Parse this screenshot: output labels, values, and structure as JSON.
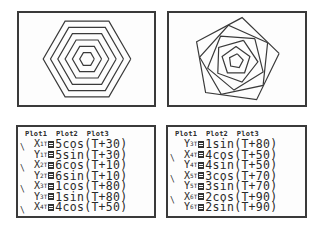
{
  "graphs": [
    {
      "name": "graph-concentric-hexagons",
      "description": "Six concentric hexagons",
      "center": [
        68,
        46
      ],
      "scale": 7.3,
      "curves": [
        {
          "r": 1,
          "phase": 80
        },
        {
          "r": 2,
          "phase": 90
        },
        {
          "r": 3,
          "phase": 70
        },
        {
          "r": 4,
          "phase": 50
        },
        {
          "r": 5,
          "phase": 30
        },
        {
          "r": 6,
          "phase": 10
        }
      ]
    },
    {
      "name": "graph-rotated-polygons",
      "description": "Rotated nested polygons",
      "center": [
        67,
        48
      ],
      "scale": 7.3,
      "curves": [
        {
          "r": 1,
          "phase": 80
        },
        {
          "r": 2,
          "phase": 90
        },
        {
          "r": 3,
          "phase": 70
        },
        {
          "r": 4,
          "phase": 50
        },
        {
          "r": 5,
          "phase": 30
        },
        {
          "r": 6,
          "phase": 10
        }
      ]
    }
  ],
  "editors": [
    {
      "plots_header": "Plot1  Plot2  Plot3",
      "lines": [
        {
          "slash": true,
          "var": "X",
          "idx": "1",
          "t": "T",
          "expr": "5cos(T+30)"
        },
        {
          "slash": false,
          "var": "Y",
          "idx": "1",
          "t": "T",
          "expr": "5sin(T+30)"
        },
        {
          "slash": true,
          "var": "X",
          "idx": "2",
          "t": "T",
          "expr": "6cos(T+10)"
        },
        {
          "slash": false,
          "var": "Y",
          "idx": "2",
          "t": "T",
          "expr": "6sin(T+10)"
        },
        {
          "slash": true,
          "var": "X",
          "idx": "3",
          "t": "T",
          "expr": "1cos(T+80)"
        },
        {
          "slash": false,
          "var": "Y",
          "idx": "3",
          "t": "T",
          "expr": "1sin(T+80)"
        },
        {
          "slash": true,
          "var": "X",
          "idx": "4",
          "t": "T",
          "expr": "4cos(T+50)"
        }
      ]
    },
    {
      "plots_header": "Plot1  Plot2  Plot3",
      "lines": [
        {
          "slash": false,
          "var": "Y",
          "idx": "3",
          "t": "T",
          "expr": "1sin(T+80)"
        },
        {
          "slash": true,
          "var": "X",
          "idx": "4",
          "t": "T",
          "expr": "4cos(T+50)"
        },
        {
          "slash": false,
          "var": "Y",
          "idx": "4",
          "t": "T",
          "expr": "4sin(T+50)"
        },
        {
          "slash": true,
          "var": "X",
          "idx": "5",
          "t": "T",
          "expr": "3cos(T+70)"
        },
        {
          "slash": false,
          "var": "Y",
          "idx": "5",
          "t": "T",
          "expr": "3sin(T+70)"
        },
        {
          "slash": true,
          "var": "X",
          "idx": "6",
          "t": "T",
          "expr": "2cos(T+90)"
        },
        {
          "slash": false,
          "var": "Y",
          "idx": "6",
          "t": "T",
          "expr": "2sin(T+90)"
        }
      ]
    }
  ]
}
